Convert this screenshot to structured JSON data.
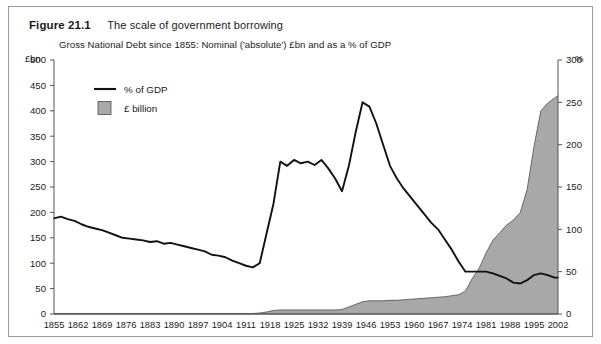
{
  "figure": {
    "label": "Figure 21.1",
    "title": "The scale of government borrowing"
  },
  "chart_data": {
    "type": "area",
    "title": "Gross National Debt since 1855: Nominal ('absolute') £bn and as a % of GDP",
    "xlabel": "",
    "ylabel": "£bn",
    "y2label": "%",
    "ylim": [
      0,
      500
    ],
    "y2lim": [
      0,
      300
    ],
    "xlim": [
      1855,
      2002
    ],
    "grid": false,
    "legend_position": "top-left",
    "colors": {
      "area_fill": "#a8a8a8",
      "area_stroke": "#4d4d4d",
      "line": "#111111",
      "axis": "#555555",
      "frame": "#9a9a9a"
    },
    "y_ticks": [
      0,
      50,
      100,
      150,
      200,
      250,
      300,
      350,
      400,
      450,
      500
    ],
    "y2_ticks": [
      0,
      50,
      100,
      150,
      200,
      250,
      300
    ],
    "x_ticks": [
      1855,
      1862,
      1869,
      1876,
      1883,
      1890,
      1897,
      1904,
      1911,
      1918,
      1925,
      1932,
      1939,
      1946,
      1953,
      1960,
      1967,
      1974,
      1981,
      1988,
      1995,
      2002
    ],
    "legend": [
      {
        "label": "% of GDP",
        "marker": "line",
        "color": "#111111"
      },
      {
        "label": "£ billion",
        "marker": "square",
        "color": "#a8a8a8"
      }
    ],
    "x": [
      1855,
      1857,
      1859,
      1861,
      1863,
      1865,
      1867,
      1869,
      1871,
      1873,
      1875,
      1877,
      1879,
      1881,
      1883,
      1885,
      1887,
      1889,
      1891,
      1893,
      1895,
      1897,
      1899,
      1901,
      1903,
      1905,
      1907,
      1909,
      1911,
      1913,
      1915,
      1917,
      1919,
      1921,
      1923,
      1925,
      1927,
      1929,
      1931,
      1933,
      1935,
      1937,
      1939,
      1941,
      1943,
      1945,
      1947,
      1949,
      1951,
      1953,
      1955,
      1957,
      1959,
      1961,
      1963,
      1965,
      1967,
      1969,
      1971,
      1973,
      1975,
      1977,
      1979,
      1981,
      1983,
      1985,
      1987,
      1989,
      1991,
      1993,
      1995,
      1997,
      1999,
      2001,
      2002
    ],
    "series": [
      {
        "name": "% of GDP",
        "axis": "right",
        "unit": "%",
        "values": [
          113,
          115,
          112,
          110,
          106,
          103,
          101,
          99,
          96,
          93,
          90,
          89,
          88,
          87,
          85,
          86,
          83,
          84,
          82,
          80,
          78,
          76,
          74,
          70,
          69,
          67,
          63,
          60,
          57,
          55,
          60,
          95,
          130,
          180,
          175,
          182,
          178,
          180,
          176,
          182,
          172,
          160,
          145,
          175,
          215,
          250,
          245,
          225,
          200,
          175,
          160,
          148,
          138,
          128,
          118,
          108,
          100,
          88,
          76,
          62,
          50,
          50,
          50,
          50,
          48,
          45,
          42,
          37,
          36,
          40,
          46,
          48,
          46,
          43,
          43
        ]
      },
      {
        "name": "£ billion",
        "axis": "left",
        "unit": "£bn",
        "values": [
          1,
          1,
          1,
          1,
          1,
          1,
          1,
          1,
          1,
          1,
          1,
          1,
          1,
          1,
          1,
          1,
          1,
          1,
          1,
          1,
          1,
          1,
          1,
          1,
          1,
          1,
          1,
          1,
          1,
          1,
          2,
          4,
          7,
          8,
          8,
          8,
          8,
          8,
          8,
          8,
          8,
          8,
          9,
          14,
          19,
          24,
          26,
          26,
          26,
          27,
          27,
          28,
          29,
          30,
          31,
          32,
          33,
          34,
          36,
          38,
          45,
          70,
          90,
          120,
          145,
          160,
          175,
          185,
          200,
          245,
          330,
          400,
          415,
          425,
          430
        ]
      }
    ],
    "annotations": [
      "WWI debt surge 1915–1923",
      "WWII peak approx 250% of GDP around 1946",
      "Nominal debt accelerates after 1975 to approx £430bn in 2002"
    ]
  }
}
